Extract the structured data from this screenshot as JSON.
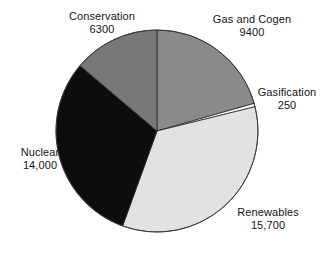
{
  "chart_data": {
    "type": "pie",
    "title": "",
    "subtitle": "",
    "xlabel": "",
    "ylabel": "",
    "legend_position": "none",
    "grid": false,
    "total": 45650,
    "units": "",
    "start_angle_deg": 0,
    "direction": "clockwise",
    "categories": [
      "Gas and Cogen",
      "Gasification",
      "Renewables",
      "Nuclear",
      "Conservation"
    ],
    "values": [
      9400,
      250,
      15700,
      14000,
      6300
    ],
    "value_labels": [
      "9400",
      "250",
      "15,700",
      "14,000",
      "6300"
    ],
    "colors": [
      "#8a8a8a",
      "#fdfdfd",
      "#e2e2e2",
      "#0d0d0d",
      "#787878"
    ],
    "slices": [
      {
        "label": "Gas and Cogen",
        "value": 9400,
        "value_label": "9400",
        "color": "#8a8a8a",
        "start_deg": 0,
        "sweep_deg": 74.13
      },
      {
        "label": "Gasification",
        "value": 250,
        "value_label": "250",
        "color": "#fdfdfd",
        "start_deg": 74.13,
        "sweep_deg": 1.97
      },
      {
        "label": "Renewables",
        "value": 15700,
        "value_label": "15,700",
        "color": "#e2e2e2",
        "start_deg": 76.1,
        "sweep_deg": 123.81
      },
      {
        "label": "Nuclear",
        "value": 14000,
        "value_label": "14,000",
        "color": "#0d0d0d",
        "start_deg": 199.91,
        "sweep_deg": 110.41
      },
      {
        "label": "Conservation",
        "value": 6300,
        "value_label": "6300",
        "color": "#787878",
        "start_deg": 310.32,
        "sweep_deg": 49.68
      }
    ]
  },
  "labels": {
    "conservation": {
      "name": "Conservation",
      "value": "6300"
    },
    "gas_and_cogen": {
      "name": "Gas and Cogen",
      "value": "9400"
    },
    "gasification": {
      "name": "Gasification",
      "value": "250"
    },
    "nuclear": {
      "name": "Nuclear",
      "value": "14,000"
    },
    "renewables": {
      "name": "Renewables",
      "value": "15,700"
    }
  },
  "geometry": {
    "center_x": 157,
    "center_y": 131,
    "radius": 101,
    "stroke": "#2a2a2a",
    "stroke_width": 0.8
  }
}
